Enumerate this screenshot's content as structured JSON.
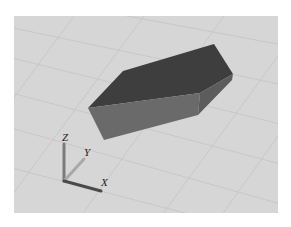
{
  "viewport": {
    "background_color": "#d6d6d6",
    "grid_color": "#c2c2c2",
    "object": {
      "type": "box",
      "top_face_color": "#3e3e3e",
      "front_face_color": "#6a6a6a",
      "side_face_color": "#5a5a5a"
    },
    "axes": {
      "x_label": "X",
      "y_label": "Y",
      "z_label": "Z",
      "x_color": "#4a4a4a",
      "y_color": "#a8a8a8",
      "z_color": "#7a7a7a"
    }
  }
}
